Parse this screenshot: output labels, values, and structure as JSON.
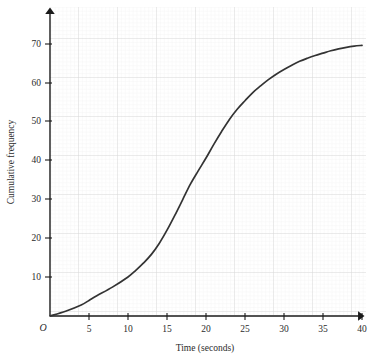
{
  "chart_data": {
    "type": "line",
    "title": "",
    "subtitle": "",
    "xlabel": "Time (seconds)",
    "ylabel": "Cumulative frequency",
    "origin_label": "O",
    "xlim": [
      0,
      42.5
    ],
    "ylim": [
      0,
      79
    ],
    "xticks": [
      5,
      10,
      15,
      20,
      25,
      30,
      35,
      40
    ],
    "xtick_labels": [
      "5",
      "10",
      "15",
      "20",
      "25",
      "30",
      "35",
      "40"
    ],
    "yticks": [
      10,
      20,
      30,
      40,
      50,
      60,
      70
    ],
    "ytick_labels": [
      "10",
      "20",
      "30",
      "40",
      "50",
      "60",
      "70"
    ],
    "grid": true,
    "grid_major_step_x": 5,
    "grid_major_step_y": 5,
    "grid_minor_step_x": 1,
    "grid_minor_step_y": 1,
    "legend": null,
    "legend_position": "none",
    "series": [
      {
        "name": "Cumulative frequency",
        "color": "#333333",
        "x": [
          0,
          2,
          4,
          5,
          6,
          8,
          10,
          11,
          12,
          13,
          14,
          15,
          16,
          17,
          18,
          19,
          20,
          21,
          22,
          23,
          24,
          25,
          26,
          27,
          28,
          29,
          30,
          31,
          32,
          33,
          34,
          35,
          36,
          37,
          38,
          39,
          40
        ],
        "values": [
          0,
          1.2,
          2.8,
          4,
          5.2,
          7.4,
          10,
          11.7,
          13.6,
          15.8,
          18.6,
          22,
          25.8,
          29.8,
          33.8,
          37.2,
          40.5,
          44,
          47.3,
          50.4,
          53,
          55.2,
          57.3,
          59,
          60.6,
          62,
          63.2,
          64.3,
          65.3,
          66.1,
          66.8,
          67.4,
          68,
          68.5,
          68.9,
          69.2,
          69.4
        ]
      }
    ],
    "colors": {
      "curve": "#333333",
      "axis": "#1a1a1a",
      "grid_minor": "#ebebeb",
      "grid_major": "#dcdcdc",
      "background": "#ffffff",
      "text": "#2b2b2b"
    }
  }
}
